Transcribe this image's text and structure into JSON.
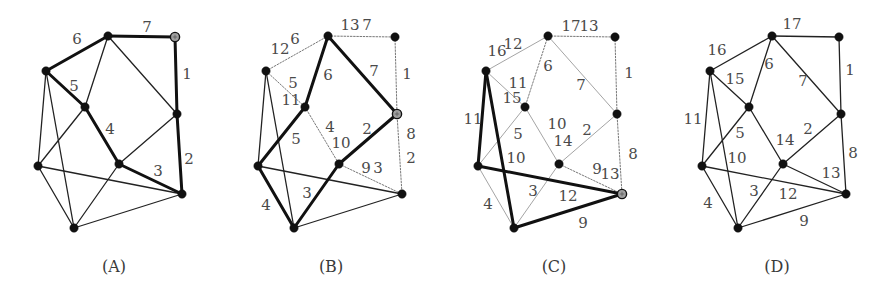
{
  "figure": {
    "nodes": {
      "a": [
        108,
        36
      ],
      "b": [
        175,
        37
      ],
      "c": [
        46,
        71
      ],
      "d": [
        85,
        107
      ],
      "e": [
        177,
        114
      ],
      "f": [
        119,
        164
      ],
      "g": [
        38,
        166
      ],
      "h": [
        182,
        194
      ],
      "i": [
        74,
        228
      ]
    },
    "edges": [
      [
        "a",
        "b"
      ],
      [
        "b",
        "e"
      ],
      [
        "e",
        "h"
      ],
      [
        "c",
        "a"
      ],
      [
        "a",
        "d"
      ],
      [
        "a",
        "e"
      ],
      [
        "c",
        "d"
      ],
      [
        "c",
        "g"
      ],
      [
        "c",
        "i"
      ],
      [
        "d",
        "g"
      ],
      [
        "d",
        "f"
      ],
      [
        "e",
        "f"
      ],
      [
        "f",
        "h"
      ],
      [
        "g",
        "h"
      ],
      [
        "g",
        "i"
      ],
      [
        "f",
        "i"
      ],
      [
        "i",
        "h"
      ]
    ],
    "style_colors": {
      "thick": "#111111",
      "thin": "#222222",
      "light": "#9a9a9a",
      "dotted": "#777777",
      "node": "#111111",
      "special_node": "#a0a0a0"
    }
  },
  "panels": [
    {
      "id": "A",
      "caption": "(A)",
      "offset_x": 0,
      "special_node": "b",
      "edge_styles": {
        "a-b": "thick",
        "b-e": "thick",
        "e-h": "thick",
        "c-a": "thick",
        "a-d": "thin",
        "a-e": "thin",
        "c-d": "thick",
        "c-g": "thin",
        "c-i": "thin",
        "d-g": "thin",
        "d-f": "thick",
        "e-f": "thin",
        "f-h": "thick",
        "g-h": "thin",
        "g-i": "thin",
        "f-i": "thin",
        "i-h": "thin"
      },
      "labels": [
        {
          "text": "7",
          "x": 147,
          "y": 28
        },
        {
          "text": "6",
          "x": 77,
          "y": 40
        },
        {
          "text": "1",
          "x": 187,
          "y": 75
        },
        {
          "text": "5",
          "x": 74,
          "y": 87
        },
        {
          "text": "4",
          "x": 110,
          "y": 130
        },
        {
          "text": "2",
          "x": 189,
          "y": 160
        },
        {
          "text": "3",
          "x": 158,
          "y": 172
        }
      ]
    },
    {
      "id": "B",
      "caption": "(B)",
      "offset_x": 220,
      "special_node": "e",
      "edge_styles": {
        "a-b": "dotted",
        "b-e": "dotted",
        "e-h": "dotted",
        "c-a": "dotted",
        "a-d": "thick",
        "a-e": "thick",
        "c-d": "dotted",
        "c-g": "thin",
        "c-i": "thin",
        "d-g": "thick",
        "d-f": "dotted",
        "e-f": "thick",
        "f-h": "dotted",
        "g-h": "thin",
        "g-i": "thick",
        "f-i": "thick",
        "i-h": "thin"
      },
      "labels": [
        {
          "text": "13",
          "x": 350,
          "y": 26
        },
        {
          "text": "7",
          "x": 367,
          "y": 26
        },
        {
          "text": "6",
          "x": 295,
          "y": 40
        },
        {
          "text": "12",
          "x": 280,
          "y": 50
        },
        {
          "text": "1",
          "x": 407,
          "y": 75
        },
        {
          "text": "6",
          "x": 328,
          "y": 76
        },
        {
          "text": "7",
          "x": 374,
          "y": 72
        },
        {
          "text": "5",
          "x": 293,
          "y": 84
        },
        {
          "text": "11",
          "x": 291,
          "y": 101
        },
        {
          "text": "4",
          "x": 330,
          "y": 128
        },
        {
          "text": "2",
          "x": 367,
          "y": 130
        },
        {
          "text": "8",
          "x": 411,
          "y": 135
        },
        {
          "text": "5",
          "x": 296,
          "y": 140
        },
        {
          "text": "10",
          "x": 341,
          "y": 144
        },
        {
          "text": "2",
          "x": 411,
          "y": 159
        },
        {
          "text": "9",
          "x": 366,
          "y": 169
        },
        {
          "text": "3",
          "x": 378,
          "y": 169
        },
        {
          "text": "3",
          "x": 307,
          "y": 194
        },
        {
          "text": "4",
          "x": 266,
          "y": 206
        }
      ]
    },
    {
      "id": "C",
      "caption": "(C)",
      "offset_x": 440,
      "special_node": "h",
      "edge_styles": {
        "a-b": "dotted",
        "b-e": "dotted",
        "e-h": "dotted",
        "c-a": "light",
        "a-d": "dotted",
        "a-e": "light",
        "c-d": "light",
        "c-g": "thick",
        "c-i": "thick",
        "d-g": "light",
        "d-f": "light",
        "e-f": "light",
        "f-h": "dotted",
        "g-h": "thick",
        "g-i": "light",
        "f-i": "light",
        "i-h": "thick"
      },
      "labels": [
        {
          "text": "17",
          "x": 571,
          "y": 27
        },
        {
          "text": "13",
          "x": 589,
          "y": 27
        },
        {
          "text": "12",
          "x": 513,
          "y": 45
        },
        {
          "text": "16",
          "x": 497,
          "y": 52
        },
        {
          "text": "6",
          "x": 548,
          "y": 67
        },
        {
          "text": "1",
          "x": 629,
          "y": 74
        },
        {
          "text": "11",
          "x": 518,
          "y": 84
        },
        {
          "text": "7",
          "x": 581,
          "y": 86
        },
        {
          "text": "15",
          "x": 512,
          "y": 99
        },
        {
          "text": "11",
          "x": 473,
          "y": 120
        },
        {
          "text": "10",
          "x": 557,
          "y": 125
        },
        {
          "text": "2",
          "x": 587,
          "y": 131
        },
        {
          "text": "5",
          "x": 518,
          "y": 135
        },
        {
          "text": "14",
          "x": 563,
          "y": 142
        },
        {
          "text": "8",
          "x": 633,
          "y": 155
        },
        {
          "text": "10",
          "x": 516,
          "y": 159
        },
        {
          "text": "9",
          "x": 597,
          "y": 170
        },
        {
          "text": "13",
          "x": 610,
          "y": 175
        },
        {
          "text": "3",
          "x": 533,
          "y": 192
        },
        {
          "text": "12",
          "x": 568,
          "y": 197
        },
        {
          "text": "4",
          "x": 488,
          "y": 205
        },
        {
          "text": "9",
          "x": 583,
          "y": 224
        }
      ]
    },
    {
      "id": "D",
      "caption": "(D)",
      "offset_x": 664,
      "special_node": null,
      "edge_styles": {
        "a-b": "thin",
        "b-e": "thin",
        "e-h": "thin",
        "c-a": "thin",
        "a-d": "thin",
        "a-e": "thin",
        "c-d": "thin",
        "c-g": "thin",
        "c-i": "thin",
        "d-g": "thin",
        "d-f": "thin",
        "e-f": "thin",
        "f-h": "thin",
        "g-h": "thin",
        "g-i": "thin",
        "f-i": "thin",
        "i-h": "thin"
      },
      "labels": [
        {
          "text": "17",
          "x": 792,
          "y": 25
        },
        {
          "text": "16",
          "x": 717,
          "y": 51
        },
        {
          "text": "6",
          "x": 769,
          "y": 65
        },
        {
          "text": "1",
          "x": 850,
          "y": 71
        },
        {
          "text": "15",
          "x": 735,
          "y": 80
        },
        {
          "text": "7",
          "x": 803,
          "y": 82
        },
        {
          "text": "11",
          "x": 693,
          "y": 120
        },
        {
          "text": "2",
          "x": 808,
          "y": 130
        },
        {
          "text": "5",
          "x": 740,
          "y": 134
        },
        {
          "text": "14",
          "x": 785,
          "y": 141
        },
        {
          "text": "8",
          "x": 853,
          "y": 154
        },
        {
          "text": "10",
          "x": 737,
          "y": 159
        },
        {
          "text": "13",
          "x": 831,
          "y": 174
        },
        {
          "text": "3",
          "x": 754,
          "y": 192
        },
        {
          "text": "12",
          "x": 788,
          "y": 195
        },
        {
          "text": "4",
          "x": 708,
          "y": 204
        },
        {
          "text": "9",
          "x": 804,
          "y": 222
        }
      ]
    }
  ],
  "captions": [
    {
      "text": "(A)",
      "x": 114,
      "y": 272
    },
    {
      "text": "(B)",
      "x": 331,
      "y": 272
    },
    {
      "text": "(C)",
      "x": 554,
      "y": 272
    },
    {
      "text": "(D)",
      "x": 777,
      "y": 272
    }
  ]
}
